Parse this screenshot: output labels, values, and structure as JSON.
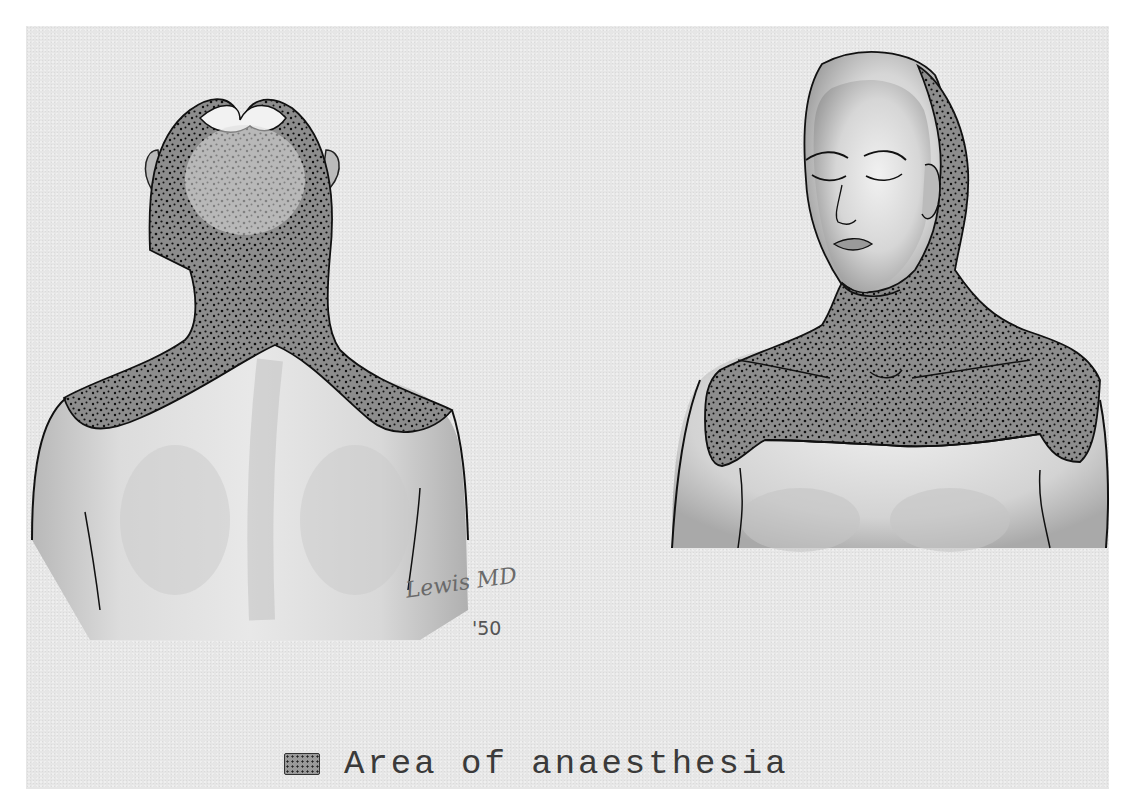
{
  "figure": {
    "panels": [
      {
        "id": "back-view",
        "label": "Posterior view of head, neck and shoulders"
      },
      {
        "id": "front-view",
        "label": "Anterior view of head, neck and upper chest"
      }
    ],
    "signature": {
      "name": "Lewis MD",
      "year": "'50"
    },
    "legend": {
      "swatch": "stippled-area",
      "label": "Area of anaesthesia"
    }
  },
  "colors": {
    "paper": "#e6e6e6",
    "border": "#ffffff",
    "ink": "#1a1a1a",
    "stipple_fill": "#8f8f8f",
    "skin": "#d9d9d9"
  }
}
